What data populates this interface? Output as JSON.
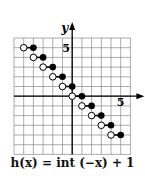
{
  "chart_data": {
    "type": "line",
    "title": "h(x) = int (−x) + 1",
    "xlabel": "x",
    "ylabel": "y",
    "xlim": [
      -6,
      6
    ],
    "ylim": [
      -6,
      6
    ],
    "grid": true,
    "tick_labels": {
      "x": "5",
      "y": "5"
    },
    "segments": [
      {
        "open": [
          -5,
          5
        ],
        "closed": [
          -4,
          5
        ]
      },
      {
        "open": [
          -4,
          4
        ],
        "closed": [
          -3,
          4
        ]
      },
      {
        "open": [
          -3,
          3
        ],
        "closed": [
          -2,
          3
        ]
      },
      {
        "open": [
          -2,
          2
        ],
        "closed": [
          -1,
          2
        ]
      },
      {
        "open": [
          -1,
          1
        ],
        "closed": [
          0,
          1
        ]
      },
      {
        "open": [
          0,
          0
        ],
        "closed": [
          1,
          0
        ]
      },
      {
        "open": [
          1,
          -1
        ],
        "closed": [
          2,
          -1
        ]
      },
      {
        "open": [
          2,
          -2
        ],
        "closed": [
          3,
          -2
        ]
      },
      {
        "open": [
          3,
          -3
        ],
        "closed": [
          4,
          -3
        ]
      },
      {
        "open": [
          4,
          -4
        ],
        "closed": [
          5,
          -4
        ]
      }
    ]
  },
  "caption": "h(x) = int (−x) + 1",
  "axis": {
    "x_label": "x",
    "y_label": "y",
    "x_tick": "5",
    "y_tick": "5"
  }
}
